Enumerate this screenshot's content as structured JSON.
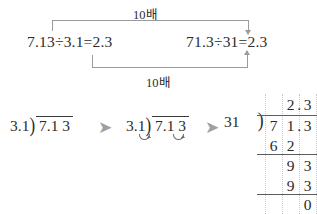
{
  "page": {
    "background_color": "#ffffff",
    "ink_color": "#2b2b2b",
    "guide_color": "#9b9b9b",
    "grid_color": "#c9c9c9",
    "arrow_color": "#9fa0a2"
  },
  "relation": {
    "left_equation": "7.13÷3.1=2.3",
    "right_equation": "71.3÷31=2.3",
    "top_label": "10배",
    "bottom_label": "10배",
    "top_bracket_arrow": "down-arrow-icon",
    "bottom_bracket_arrow": "up-arrow-icon"
  },
  "steps": {
    "step1": {
      "divisor": "3.1",
      "dividend": "7.1 3",
      "paren": ")",
      "has_shift_marks": "false"
    },
    "step2": {
      "divisor": "3.1",
      "dividend": "7.1 3",
      "paren": ")",
      "has_shift_marks": "true",
      "shift_mark_icon": "decimal-shift-arc-icon"
    },
    "arrow_1": "➤",
    "arrow_2": "➤"
  },
  "worked": {
    "divisor": "31",
    "paren": ")",
    "quotient": [
      "2",
      "3"
    ],
    "quotient_decimal_after": "2",
    "dividend": [
      "7",
      "1",
      "3"
    ],
    "dividend_decimal_after": "1",
    "partial_1": [
      "6",
      "2"
    ],
    "partial_2": [
      "9",
      "3"
    ],
    "partial_3": [
      "9",
      "3"
    ],
    "remainder": [
      "0"
    ]
  }
}
